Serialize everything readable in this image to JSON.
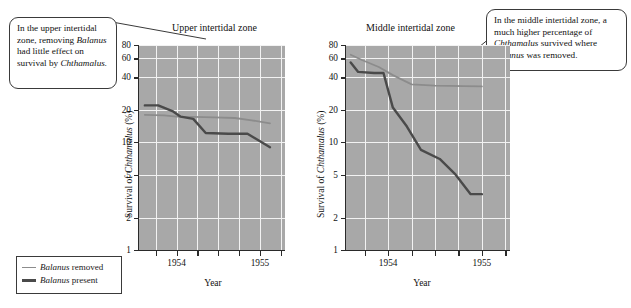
{
  "figure": {
    "callouts": [
      {
        "id": "upper",
        "line1": "In the upper intertidal",
        "line2_a": "zone, removing",
        "line3_i": "Balanus",
        "line3_b": " had little",
        "line4": "effect on survival",
        "line5_b": "by ",
        "line5_i": "Chthamalus."
      },
      {
        "id": "middle",
        "line1": "In the middle intertidal zone,",
        "line2": "a much higher percentage of",
        "line3_i": "Chthamalus",
        "line3_b": " survived where",
        "line4_i": "Balanus",
        "line4_b": " was removed."
      }
    ],
    "legend": {
      "items": [
        {
          "label_i": "Balanus",
          "label_b": " removed",
          "color": "#8c8c8c",
          "key": "removed"
        },
        {
          "label_i": "Balanus",
          "label_b": " present",
          "color": "#4a4a4a",
          "key": "present"
        }
      ]
    },
    "colors": {
      "plot_background": "#a8a8a8",
      "gridline": "#f2f2f2",
      "axis": "#2a2a2a",
      "series_removed": "#8c8c8c",
      "series_present": "#4a4a4a"
    }
  },
  "chart_data": [
    {
      "type": "line",
      "id": "upper-intertidal-zone",
      "title": "Upper intertidal zone",
      "xlabel": "Year",
      "ylabel": "Survival of Chthamalus (%)",
      "ylabel_italic_part": "Chthamalus",
      "yscale": "log",
      "ylim": [
        1,
        80
      ],
      "yticks": [
        1,
        2,
        5,
        10,
        20,
        40,
        60,
        80
      ],
      "ytick_labels": [
        "1",
        "2",
        "5",
        "10",
        "20",
        "40",
        "60",
        "80"
      ],
      "xlim": [
        1953.55,
        1955.3
      ],
      "xticks": [
        1953.75,
        1954.0,
        1954.25,
        1954.5,
        1954.75,
        1955.0,
        1955.25
      ],
      "xtick_labeled": [
        1954,
        1955
      ],
      "xtick_labels": [
        "1954",
        "1955"
      ],
      "grid": true,
      "legend_position": "outside-bottom-left",
      "series": [
        {
          "name": "Balanus removed",
          "color": "#8c8c8c",
          "x": [
            1953.62,
            1953.85,
            1954.0,
            1954.2,
            1954.45,
            1954.7,
            1954.9,
            1955.12
          ],
          "values": [
            18.0,
            17.8,
            17.3,
            17.2,
            17.0,
            16.8,
            16.0,
            15.0
          ]
        },
        {
          "name": "Balanus present",
          "color": "#4a4a4a",
          "x": [
            1953.62,
            1953.78,
            1953.95,
            1954.05,
            1954.2,
            1954.35,
            1954.62,
            1954.85,
            1955.12
          ],
          "values": [
            22.0,
            22.0,
            19.5,
            17.3,
            16.5,
            12.2,
            12.0,
            12.0,
            9.0
          ]
        }
      ]
    },
    {
      "type": "line",
      "id": "middle-intertidal-zone",
      "title": "Middle intertidal zone",
      "xlabel": "Year",
      "ylabel": "Survival of Chthamalus (%)",
      "ylabel_italic_part": "Chthamalus",
      "yscale": "log",
      "ylim": [
        1,
        80
      ],
      "yticks": [
        1,
        2,
        5,
        10,
        20,
        40,
        60,
        80
      ],
      "ytick_labels": [
        "1",
        "2",
        "5",
        "10",
        "20",
        "40",
        "60",
        "80"
      ],
      "xlim": [
        1953.55,
        1955.3
      ],
      "xticks": [
        1953.75,
        1954.0,
        1954.25,
        1954.5,
        1954.75,
        1955.0,
        1955.25
      ],
      "xtick_labeled": [
        1954,
        1955
      ],
      "xtick_labels": [
        "1954",
        "1955"
      ],
      "grid": true,
      "legend_position": "shared-with-left-panel",
      "series": [
        {
          "name": "Balanus removed",
          "color": "#8c8c8c",
          "x": [
            1953.6,
            1953.72,
            1953.9,
            1954.05,
            1954.25,
            1954.5,
            1954.8,
            1955.0
          ],
          "values": [
            65.0,
            58.0,
            50.0,
            42.0,
            34.5,
            33.5,
            33.2,
            33.0
          ]
        },
        {
          "name": "Balanus present",
          "color": "#4a4a4a",
          "x": [
            1953.6,
            1953.68,
            1953.85,
            1953.95,
            1954.05,
            1954.2,
            1954.35,
            1954.55,
            1954.72,
            1954.88,
            1955.0
          ],
          "values": [
            55.0,
            45.0,
            44.0,
            44.0,
            21.0,
            14.0,
            8.5,
            7.0,
            5.0,
            3.3,
            3.3
          ]
        }
      ]
    }
  ]
}
